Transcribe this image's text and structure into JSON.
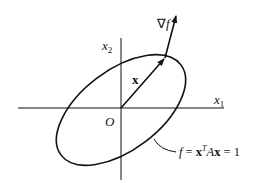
{
  "diagram": {
    "type": "quadratic-form-level-set",
    "axes": {
      "x_label": "x",
      "x_sub": "1",
      "y_label": "x",
      "y_sub": "2",
      "origin_label": "O"
    },
    "vector_label": "x",
    "gradient_label": {
      "nabla": "∇",
      "f": "f"
    },
    "curve_label": {
      "f": "f",
      "eq1": " = ",
      "x": "x",
      "sup": "T",
      "A": "A",
      "x2": "x",
      "eq2": " = 1"
    },
    "colors": {
      "ink": "#111111",
      "background": "#ffffff"
    }
  }
}
